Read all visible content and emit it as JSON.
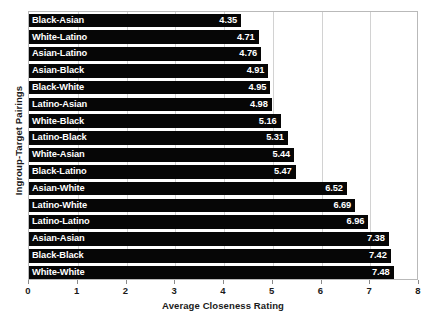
{
  "chart_data": {
    "type": "bar",
    "orientation": "horizontal",
    "title": "",
    "xlabel": "Average Closeness Rating",
    "ylabel": "Ingroup-Target Pairings",
    "xlim": [
      0,
      8
    ],
    "xticks": [
      0,
      1,
      2,
      3,
      4,
      5,
      6,
      7,
      8
    ],
    "xtick_labels": [
      "0",
      "1",
      "2",
      "3",
      "4",
      "5",
      "6",
      "7",
      "8"
    ],
    "grid": "vertical-only",
    "legend": "none",
    "bar_color": "#060606",
    "label_color": "#ffffff",
    "categories": [
      "Black-Asian",
      "White-Latino",
      "Asian-Latino",
      "Asian-Black",
      "Black-White",
      "Latino-Asian",
      "White-Black",
      "Latino-Black",
      "White-Asian",
      "Black-Latino",
      "Asian-White",
      "Latino-White",
      "Latino-Latino",
      "Asian-Asian",
      "Black-Black",
      "White-White"
    ],
    "values": [
      4.35,
      4.71,
      4.76,
      4.91,
      4.95,
      4.98,
      5.16,
      5.31,
      5.44,
      5.47,
      6.52,
      6.69,
      6.96,
      7.38,
      7.42,
      7.48
    ],
    "value_labels": [
      "4.35",
      "4.71",
      "4.76",
      "4.91",
      "4.95",
      "4.98",
      "5.16",
      "5.31",
      "5.44",
      "5.47",
      "6.52",
      "6.69",
      "6.96",
      "7.38",
      "7.42",
      "7.48"
    ]
  }
}
